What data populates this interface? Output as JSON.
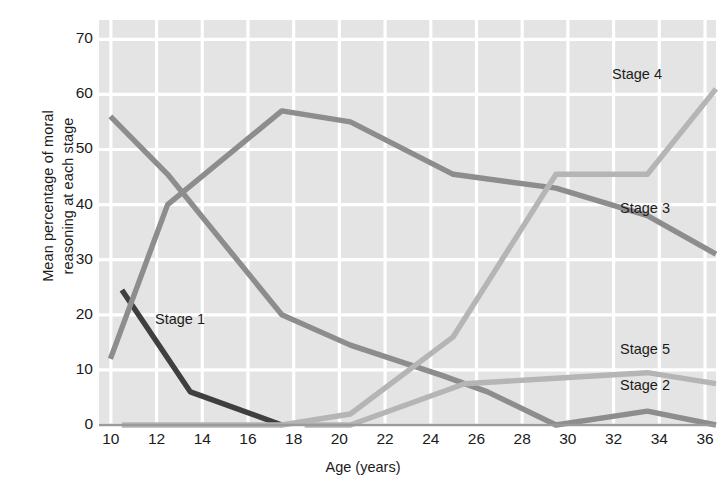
{
  "chart_data": {
    "type": "line",
    "title": "",
    "xlabel": "Age (years)",
    "ylabel": "Mean percentage of moral reasoning at each stage",
    "ylabel_lines": [
      "Mean percentage of moral",
      "reasoning at each stage"
    ],
    "xlim": [
      9,
      36
    ],
    "ylim": [
      0,
      70
    ],
    "xticks": [
      10,
      12,
      14,
      16,
      18,
      20,
      22,
      24,
      26,
      28,
      30,
      32,
      34,
      36
    ],
    "yticks": [
      0,
      10,
      20,
      30,
      40,
      50,
      60,
      70
    ],
    "grid": true,
    "legend_position": "inline-右-labels",
    "plot_background": "#e4e4e4",
    "gridline_color": "#ffffff",
    "axis_color": "#9a9a9a",
    "series": [
      {
        "name": "Stage 1",
        "color": "#3f3f3f",
        "label_x": 155,
        "label_y": 311,
        "x": [
          10,
          13,
          17
        ],
        "values": [
          24.5,
          6,
          0
        ]
      },
      {
        "name": "Stage 2",
        "color": "#8d8d8d",
        "label_x": 620,
        "label_y": 377,
        "x": [
          9.5,
          12,
          17,
          20,
          24,
          26,
          29,
          33,
          36
        ],
        "values": [
          56,
          45.5,
          20,
          14.5,
          9,
          6,
          0,
          2.5,
          0
        ]
      },
      {
        "name": "Stage 3",
        "color": "#8d8d8d",
        "label_x": 620,
        "label_y": 200,
        "x": [
          9.5,
          12,
          17,
          20,
          24.5,
          29,
          33,
          36
        ],
        "values": [
          12,
          40,
          57,
          55,
          45.5,
          43,
          38,
          31
        ]
      },
      {
        "name": "Stage 4",
        "color": "#b5b5b5",
        "label_x": 612,
        "label_y": 66,
        "x": [
          10,
          17,
          20,
          24.5,
          29,
          33,
          36
        ],
        "values": [
          0,
          0,
          2,
          16,
          45.5,
          45.5,
          61
        ]
      },
      {
        "name": "Stage 5",
        "color": "#b5b5b5",
        "label_x": 620,
        "label_y": 341,
        "x": [
          18,
          20,
          25,
          29,
          33,
          36
        ],
        "values": [
          0,
          0,
          7.5,
          8.5,
          9.5,
          7.5
        ]
      }
    ]
  }
}
